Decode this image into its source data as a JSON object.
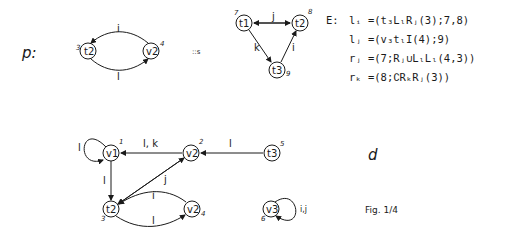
{
  "figure": {
    "left_label": "p:",
    "right_label": "d",
    "sep_label": "::s",
    "caption": "Fig. 1/4"
  },
  "graph_p": {
    "nodes": [
      {
        "id": "t2",
        "label": "t2",
        "num": "3"
      },
      {
        "id": "v2",
        "label": "v2",
        "num": "4"
      }
    ],
    "edges": [
      {
        "from": "v2",
        "to": "t2",
        "label": "i"
      },
      {
        "from": "t2",
        "to": "v2",
        "label": "l"
      }
    ]
  },
  "graph_s": {
    "nodes": [
      {
        "id": "t1",
        "label": "t1",
        "num": "7"
      },
      {
        "id": "t2",
        "label": "t2",
        "num": "8"
      },
      {
        "id": "t3",
        "label": "t3",
        "num": "9"
      }
    ],
    "edges": [
      {
        "from": "t1",
        "to": "t2",
        "label": "j",
        "bidirectional": true
      },
      {
        "from": "t1",
        "to": "t3",
        "label": "k"
      },
      {
        "from": "t3",
        "to": "t2",
        "label": "i"
      }
    ]
  },
  "equations": {
    "prefix": "E:",
    "lines": [
      "lᵢ =(t₃LₗRⱼ(3);7,8)",
      "lⱼ =(v₃tₗI(4);9)",
      "rⱼ =(7;Rⱼ∪LₗLₗ(4,3))",
      "rₖ =(8;∁RₖRⱼ(3))"
    ]
  },
  "graph_d": {
    "nodes": [
      {
        "id": "v1",
        "label": "v1",
        "num": "1"
      },
      {
        "id": "v2a",
        "label": "v2",
        "num": "2"
      },
      {
        "id": "t3",
        "label": "t3",
        "num": "5"
      },
      {
        "id": "t2",
        "label": "t2",
        "num": "3"
      },
      {
        "id": "v2b",
        "label": "v2",
        "num": "4"
      },
      {
        "id": "v3",
        "label": "v3",
        "num": "6"
      }
    ],
    "edges": [
      {
        "from": "v1",
        "to": "v1",
        "label": "l"
      },
      {
        "from": "v2a",
        "to": "v1",
        "label": "l, k"
      },
      {
        "from": "t3",
        "to": "v2a",
        "label": "l"
      },
      {
        "from": "v1",
        "to": "t2",
        "label": "l"
      },
      {
        "from": "t2",
        "to": "v2a",
        "label": "j",
        "bidirectional": true
      },
      {
        "from": "v2b",
        "to": "t2",
        "label": "i"
      },
      {
        "from": "t2",
        "to": "v2b",
        "label": "l"
      },
      {
        "from": "v3",
        "to": "v3",
        "label": "i,j"
      }
    ]
  }
}
